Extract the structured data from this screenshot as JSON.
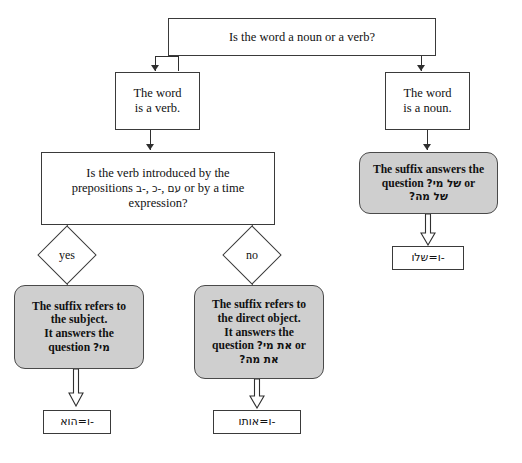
{
  "diagram": {
    "colors": {
      "gray_fill": "#cfcfcf",
      "white_fill": "#ffffff",
      "line": "#2f2f2f",
      "text": "#111111"
    },
    "root": {
      "label": "Is the word a noun or a verb?"
    },
    "verb_branch": {
      "label_line1": "The word",
      "label_line2": "is a verb.",
      "question": {
        "line1": "Is the verb introduced by the",
        "line2_pre": "prepositions ",
        "line2_heb1": "‎-ב",
        "line2_sep1": ", ",
        "line2_heb2": "‎-כ",
        "line2_sep2": ", ",
        "line2_heb3": "עם",
        "line2_post": " or by a time",
        "line3": "expression?"
      },
      "yes_label": "yes",
      "no_label": "no",
      "yes_outcome": {
        "line1": "The suffix refers to",
        "line2": "the subject.",
        "line3": "It answers the",
        "line4_pre": "question ",
        "line4_heb": "מי?",
        "result": "‎-ו=הוא"
      },
      "no_outcome": {
        "line1": "The suffix refers to",
        "line2": "the direct object.",
        "line3": "It answers the",
        "line4_pre": "question ",
        "line4_heb": "את מי?",
        "line4_post": " or",
        "line5_heb": "את מה?",
        "result": "‎-ו=אותו"
      }
    },
    "noun_branch": {
      "label_line1": "The word",
      "label_line2": "is a noun.",
      "outcome": {
        "line1": "The suffix answers the",
        "line2_pre": "question ",
        "line2_heb": "של מי?",
        "line2_post": " or",
        "line3_heb": "של מה?",
        "result": "‎-ו=שלו"
      }
    }
  }
}
